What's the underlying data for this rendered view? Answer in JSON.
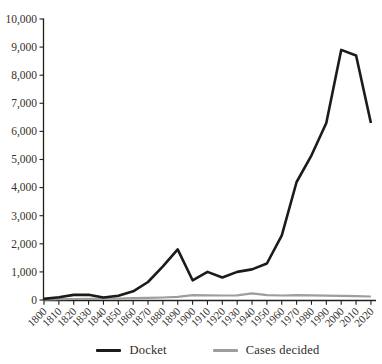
{
  "chart_data": {
    "type": "line",
    "x": [
      1800,
      1810,
      1820,
      1830,
      1840,
      1850,
      1860,
      1870,
      1880,
      1890,
      1900,
      1910,
      1920,
      1930,
      1940,
      1950,
      1960,
      1970,
      1980,
      1990,
      2000,
      2010,
      2020
    ],
    "xtick_labels": [
      "1800",
      "1810",
      "1820",
      "1830",
      "1840",
      "1850",
      "1860",
      "1870",
      "1880",
      "1890",
      "1900",
      "1910",
      "1920",
      "1930",
      "1940",
      "1950",
      "1960",
      "1970",
      "1980",
      "1990",
      "2000",
      "2010",
      "2020"
    ],
    "series": [
      {
        "name": "Docket",
        "color": "#1d1a17",
        "stroke_width": 2.6,
        "values": [
          40,
          100,
          180,
          190,
          90,
          150,
          310,
          640,
          1200,
          1800,
          700,
          1000,
          800,
          1000,
          1090,
          1300,
          2300,
          4200,
          5150,
          6300,
          8900,
          8700,
          6300
        ]
      },
      {
        "name": "Cases decided",
        "color": "#9d9d9d",
        "stroke_width": 2.2,
        "values": [
          10,
          30,
          35,
          40,
          45,
          55,
          65,
          75,
          90,
          110,
          170,
          165,
          160,
          165,
          240,
          170,
          160,
          175,
          165,
          155,
          145,
          135,
          125
        ]
      }
    ],
    "ylim": [
      0,
      10000
    ],
    "ytick_step": 1000,
    "ytick_labels": [
      "0",
      "1,000",
      "2,000",
      "3,000",
      "4,000",
      "5,000",
      "6,000",
      "7,000",
      "8,000",
      "9,000",
      "10,000"
    ],
    "grid": false,
    "legend_position": "bottom"
  }
}
